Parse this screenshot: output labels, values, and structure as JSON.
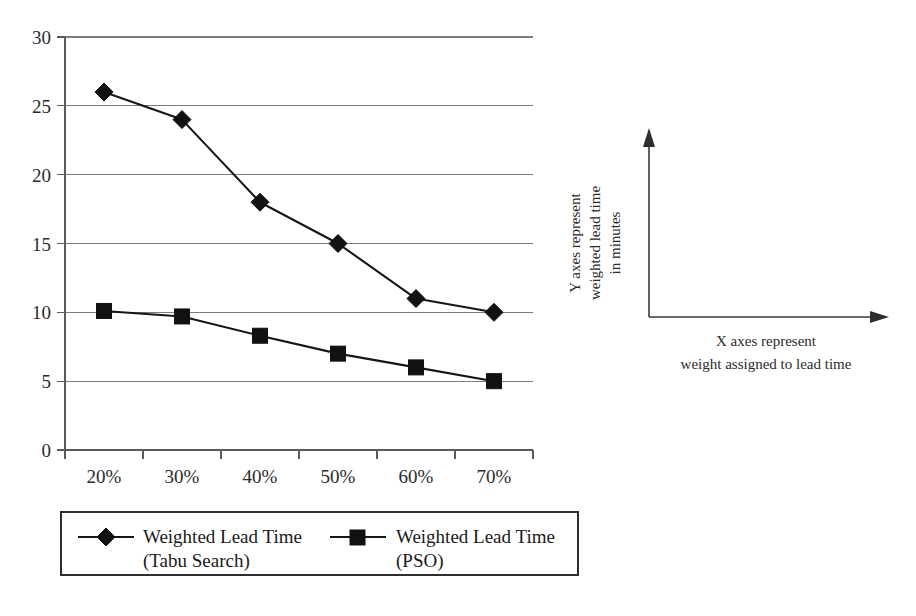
{
  "chart_data": {
    "type": "line",
    "title": "",
    "subtitle": "",
    "xlabel": "X axes represent weight assigned to lead time",
    "ylabel": "Y axes represent weighted lead time in minutes",
    "categories": [
      "20%",
      "30%",
      "40%",
      "50%",
      "60%",
      "70%"
    ],
    "ylim": [
      0,
      30
    ],
    "yticks": [
      0,
      5,
      10,
      15,
      20,
      25,
      30
    ],
    "ytick_labels": [
      "0",
      "5",
      "10",
      "15",
      "20",
      "25",
      "30"
    ],
    "grid": "horizontal",
    "legend_position": "bottom",
    "series": [
      {
        "name": "Weighted Lead Time (Tabu Search)",
        "name_line1": "Weighted Lead Time",
        "name_line2": "(Tabu Search)",
        "marker": "diamond",
        "color": "#111111",
        "values": [
          26,
          24,
          18,
          15,
          11,
          10
        ]
      },
      {
        "name": "Weighted Lead Time (PSO)",
        "name_line1": "Weighted Lead Time",
        "name_line2": "(PSO)",
        "marker": "square",
        "color": "#111111",
        "values": [
          10.1,
          9.7,
          8.3,
          7,
          6,
          5
        ]
      }
    ]
  },
  "axis_annotation": {
    "y_line1": "Y axes represent",
    "y_line2": "weighted lead time",
    "y_line3": "in minutes",
    "x_line1": "X axes represent",
    "x_line2": "weight assigned to lead time",
    "y_arrow_icon": "up-arrow-icon",
    "x_arrow_icon": "right-arrow-icon"
  },
  "colors": {
    "background": "#ffffff",
    "ink": "#111111",
    "grid": "#7c7c7c",
    "axis": "#5a5a5a"
  }
}
